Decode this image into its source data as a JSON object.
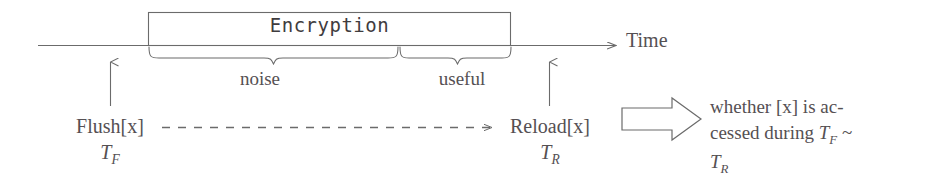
{
  "diagram": {
    "axis": {
      "label": "Time",
      "arrow_icon": "arrow-right-icon"
    },
    "operation_box": {
      "label": "Encryption"
    },
    "braces": [
      {
        "name": "noise",
        "label": "noise"
      },
      {
        "name": "useful",
        "label": "useful"
      }
    ],
    "markers": [
      {
        "name": "flush",
        "label": "Flush[x]",
        "time_symbol": "T",
        "time_subscript": "F",
        "pointer_icon": "arrow-up-icon"
      },
      {
        "name": "reload",
        "label": "Reload[x]",
        "time_symbol": "T",
        "time_subscript": "R",
        "pointer_icon": "arrow-up-icon"
      }
    ],
    "measurement_link": {
      "name": "flush-to-reload-interval",
      "style": "dashed",
      "arrow_icon": "arrow-right-icon"
    },
    "implication": {
      "arrow_icon": "block-arrow-right-icon",
      "lines": [
        "whether [x] is ac-",
        "cessed during T_F ~",
        "T_R"
      ],
      "line1": "whether [x] is ac-",
      "line2_prefix": "cessed during ",
      "line2_var": "T",
      "line2_sub": "F",
      "line2_suffix": " ~",
      "line3_var": "T",
      "line3_sub": "R"
    },
    "colors": {
      "stroke": "#6b6b6b",
      "text": "#555053",
      "background": "#ffffff"
    }
  }
}
